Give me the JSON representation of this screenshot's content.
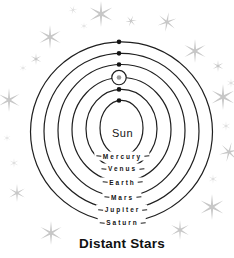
{
  "title": "Distant Stars",
  "sun": {
    "label": "Sun"
  },
  "colors": {
    "background": "#ffffff",
    "orbit_line": "#1f1f1f",
    "planet_dot": "#141414",
    "earth_dot": "#9c9c9c",
    "moon_orbit_ring": "#1f1f1f",
    "star": "#c7c7c7",
    "star_faint": "#dddddd",
    "label_text": "#141414",
    "title_text": "#111111"
  },
  "geometry": {
    "center_x": 121.5,
    "dot_x": 119,
    "dot_radius": 2.3,
    "moon_ring_radius": 7.2,
    "sun_pos": {
      "x": 122.5,
      "y": 132.5
    },
    "title_pos": {
      "x": 122,
      "y": 242.5
    },
    "orbits": [
      {
        "planet": "Mercury",
        "cy": 128.0,
        "rx": 21.5,
        "ry": 27.7,
        "label_y": 155.7,
        "has_moon_ring": false
      },
      {
        "planet": "Venus",
        "cy": 128.8,
        "rx": 35.5,
        "ry": 39.5,
        "label_y": 168.3,
        "has_moon_ring": false
      },
      {
        "planet": "Earth",
        "cy": 129.5,
        "rx": 49.5,
        "ry": 52.0,
        "label_y": 181.7,
        "has_moon_ring": true
      },
      {
        "planet": "Mars",
        "cy": 130.5,
        "rx": 63.5,
        "ry": 66.0,
        "label_y": 196.7,
        "has_moon_ring": false
      },
      {
        "planet": "Jupiter",
        "cy": 131.3,
        "rx": 77.5,
        "ry": 78.0,
        "label_y": 209.3,
        "has_moon_ring": false
      },
      {
        "planet": "Saturn",
        "cy": 131.8,
        "rx": 91.0,
        "ry": 90.0,
        "label_y": 221.8,
        "has_moon_ring": false
      }
    ]
  },
  "stars": [
    {
      "x": 50,
      "y": 37,
      "r": 12,
      "faint": false,
      "rot": 0
    },
    {
      "x": 73,
      "y": 10,
      "r": 5,
      "faint": true,
      "rot": 15
    },
    {
      "x": 101,
      "y": 14,
      "r": 13,
      "faint": false,
      "rot": 0
    },
    {
      "x": 131,
      "y": 21,
      "r": 6,
      "faint": false,
      "rot": 20
    },
    {
      "x": 84,
      "y": 26,
      "r": 4,
      "faint": true,
      "rot": 0
    },
    {
      "x": 167,
      "y": 22,
      "r": 10,
      "faint": false,
      "rot": 10
    },
    {
      "x": 195,
      "y": 51,
      "r": 12,
      "faint": false,
      "rot": 0
    },
    {
      "x": 218,
      "y": 66,
      "r": 6,
      "faint": false,
      "rot": 0
    },
    {
      "x": 231,
      "y": 83,
      "r": 5,
      "faint": true,
      "rot": 0
    },
    {
      "x": 223,
      "y": 97,
      "r": 13,
      "faint": false,
      "rot": 0
    },
    {
      "x": 226,
      "y": 126,
      "r": 5,
      "faint": true,
      "rot": 0
    },
    {
      "x": 229,
      "y": 152,
      "r": 10,
      "faint": false,
      "rot": 15
    },
    {
      "x": 213,
      "y": 179,
      "r": 5,
      "faint": true,
      "rot": 0
    },
    {
      "x": 212,
      "y": 207,
      "r": 13,
      "faint": false,
      "rot": 0
    },
    {
      "x": 180,
      "y": 230,
      "r": 10,
      "faint": false,
      "rot": 0
    },
    {
      "x": 36,
      "y": 59,
      "r": 6,
      "faint": false,
      "rot": 0
    },
    {
      "x": 23,
      "y": 68,
      "r": 4,
      "faint": true,
      "rot": 0
    },
    {
      "x": 9,
      "y": 100,
      "r": 12,
      "faint": false,
      "rot": 0
    },
    {
      "x": 7,
      "y": 138,
      "r": 4,
      "faint": true,
      "rot": 0
    },
    {
      "x": 14,
      "y": 163,
      "r": 5,
      "faint": true,
      "rot": 0
    },
    {
      "x": 17,
      "y": 193,
      "r": 9,
      "faint": false,
      "rot": 0
    },
    {
      "x": 51,
      "y": 233,
      "r": 12,
      "faint": false,
      "rot": 0
    }
  ]
}
